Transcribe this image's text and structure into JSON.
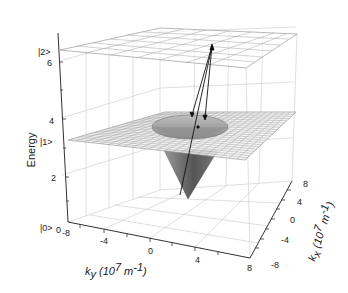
{
  "chart_data": {
    "type": "surface3d",
    "title": "",
    "zlabel": "Energy",
    "xlabel": "k_y (10^7 m^-1)",
    "ylabel": "k_x (10^7 m^-1)",
    "xlabel_parts": {
      "k": "k",
      "sub": "y",
      "unit": "(10",
      "exp": "7",
      "unit2": " m",
      "exp2": "-1",
      "close": ")"
    },
    "ylabel_parts": {
      "k": "k",
      "sub": "x",
      "unit": "(10",
      "exp": "7",
      "unit2": " m",
      "exp2": "-1",
      "close": ")"
    },
    "z_ticks": [
      "2",
      "4",
      "6"
    ],
    "x_ticks": [
      "-8",
      "-4",
      "0",
      "4",
      "8"
    ],
    "y_ticks": [
      "-8",
      "-4",
      "0",
      "4",
      "8"
    ],
    "x_range": [
      -8,
      8
    ],
    "y_range": [
      -8,
      8
    ],
    "z_range": [
      0,
      7
    ],
    "state_labels": [
      "|2>",
      "|1>",
      "|0>"
    ],
    "state_energies": [
      6.5,
      3.4,
      0
    ],
    "corner_label": "0",
    "surfaces": [
      {
        "name": "upper level |2>",
        "shape": "flat plane",
        "energy": 6.5
      },
      {
        "name": "middle level |1>",
        "shape": "flat plane with conical dip",
        "energy": 3.4,
        "dip_radius": 3.5,
        "dip_min_energy": 1.0
      }
    ],
    "arrows": [
      {
        "description": "transitions from rim of cone in |1> plane up to a point on |2> plane",
        "count": 3
      }
    ],
    "grid": true,
    "legend": null
  }
}
